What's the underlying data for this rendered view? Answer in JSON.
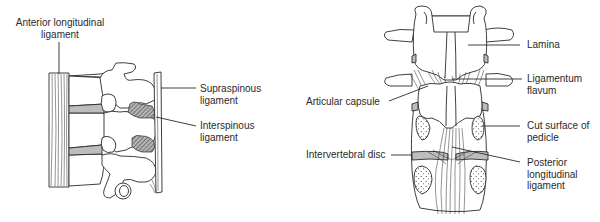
{
  "figure": {
    "left_panel": {
      "view": "lateral",
      "labels": [
        {
          "id": "anterior-longitudinal-ligament",
          "lines": [
            "Anterior longitudinal",
            "ligament"
          ]
        },
        {
          "id": "supraspinous-ligament",
          "lines": [
            "Supraspinous",
            "ligament"
          ]
        },
        {
          "id": "interspinous-ligament",
          "lines": [
            "Interspinous",
            "ligament"
          ]
        }
      ]
    },
    "right_panel": {
      "view": "posterior",
      "labels": [
        {
          "id": "lamina",
          "lines": [
            "Lamina"
          ]
        },
        {
          "id": "ligamentum-flavum",
          "lines": [
            "Ligamentum",
            "flavum"
          ]
        },
        {
          "id": "articular-capsule",
          "lines": [
            "Articular capsule"
          ]
        },
        {
          "id": "cut-surface-of-pedicle",
          "lines": [
            "Cut surface of",
            "pedicle"
          ]
        },
        {
          "id": "intervertebral-disc",
          "lines": [
            "Intervertebral disc"
          ]
        },
        {
          "id": "posterior-longitudinal-ligament",
          "lines": [
            "Posterior",
            "longitudinal",
            "ligament"
          ]
        }
      ]
    },
    "colors": {
      "line": "#2a2a2a",
      "disc_fill": "#bdbdbd",
      "hatch_fill": "#8a8a8a",
      "background": "#ffffff"
    }
  }
}
